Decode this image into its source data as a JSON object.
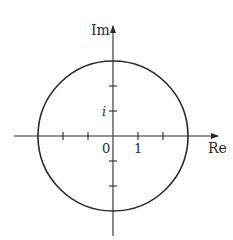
{
  "diagram": {
    "type": "complex-plane-circle",
    "axes": {
      "horizontal_label": "Re",
      "vertical_label": "Im"
    },
    "tick_labels": {
      "origin": "0",
      "real_one": "1",
      "imag_one": "i"
    },
    "circle": {
      "center": [
        0,
        0
      ],
      "radius_units": 3
    },
    "ticks": {
      "real": [
        -2,
        -1,
        1,
        2
      ],
      "imag": [
        -2,
        -1,
        1,
        2
      ]
    },
    "colors": {
      "stroke": "#2a2a2a",
      "background": "#ffffff"
    }
  }
}
